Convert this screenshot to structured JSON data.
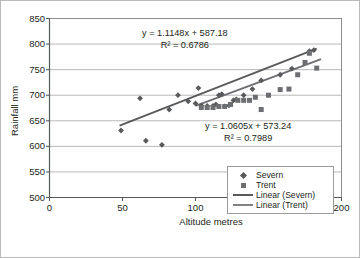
{
  "chart_data": {
    "type": "scatter",
    "title": "",
    "xlabel": "Altitude metres",
    "ylabel": "Rainfall mm",
    "xlim": [
      0,
      200
    ],
    "ylim": [
      500,
      850
    ],
    "xticks": [
      0,
      50,
      100,
      150,
      200
    ],
    "yticks": [
      500,
      550,
      600,
      650,
      700,
      750,
      800,
      850
    ],
    "grid": "horizontal",
    "legend_position": "bottom-right",
    "legend_entries": [
      {
        "label": "Severn",
        "marker": "diamond",
        "color": "#58595b"
      },
      {
        "label": "Trent",
        "marker": "square",
        "color": "#6d6e71"
      },
      {
        "label": "Linear (Severn)",
        "marker": "line",
        "color": "#58595b"
      },
      {
        "label": "Linear (Trent)",
        "marker": "line",
        "color": "#808285"
      }
    ],
    "annotations": [
      {
        "name": "severn-trendline-equation",
        "line1": "y = 1.1148x + 587.18",
        "line2": "R² = 0.6786"
      },
      {
        "name": "trent-trendline-equation",
        "line1": "y = 1.0605x + 573.24",
        "line2": "R² = 0.7989"
      }
    ],
    "series": [
      {
        "name": "Severn",
        "marker": "diamond",
        "color": "#58595b",
        "points": [
          [
            49,
            631
          ],
          [
            62,
            694
          ],
          [
            66,
            611
          ],
          [
            77,
            603
          ],
          [
            82,
            672
          ],
          [
            88,
            700
          ],
          [
            95,
            688
          ],
          [
            100,
            684
          ],
          [
            102,
            714
          ],
          [
            104,
            680
          ],
          [
            108,
            679
          ],
          [
            112,
            679
          ],
          [
            114,
            682
          ],
          [
            116,
            700
          ],
          [
            118,
            702
          ],
          [
            120,
            678
          ],
          [
            123,
            680
          ],
          [
            126,
            690
          ],
          [
            128,
            692
          ],
          [
            133,
            700
          ],
          [
            139,
            712
          ],
          [
            145,
            729
          ],
          [
            158,
            740
          ],
          [
            166,
            752
          ],
          [
            178,
            786
          ],
          [
            181,
            788
          ]
        ],
        "trendline": {
          "slope": 1.1148,
          "intercept": 587.18,
          "r2": 0.6786,
          "x_start": 48,
          "x_end": 183
        }
      },
      {
        "name": "Trent",
        "marker": "square",
        "color": "#6d6e71",
        "points": [
          [
            104,
            676
          ],
          [
            108,
            676
          ],
          [
            112,
            676
          ],
          [
            116,
            678
          ],
          [
            120,
            678
          ],
          [
            124,
            682
          ],
          [
            129,
            690
          ],
          [
            133,
            690
          ],
          [
            137,
            690
          ],
          [
            141,
            696
          ],
          [
            145,
            672
          ],
          [
            150,
            700
          ],
          [
            158,
            711
          ],
          [
            164,
            712
          ],
          [
            170,
            740
          ],
          [
            175,
            764
          ],
          [
            178,
            782
          ],
          [
            183,
            753
          ]
        ],
        "trendline": {
          "slope": 1.0605,
          "intercept": 573.24,
          "r2": 0.7989,
          "x_start": 100,
          "x_end": 186
        }
      }
    ]
  },
  "axes": {
    "ytick_labels": [
      "850",
      "800",
      "750",
      "700",
      "650",
      "600",
      "550",
      "500"
    ],
    "xtick_labels": [
      "0",
      "50",
      "100",
      "150",
      "200"
    ],
    "ylabel": "Rainfall mm",
    "xlabel": "Altitude metres"
  },
  "equations": {
    "severn_line1": "y = 1.1148x + 587.18",
    "severn_line2": "R² = 0.6786",
    "trent_line1": "y = 1.0605x + 573.24",
    "trent_line2": "R² = 0.7989"
  },
  "legend": {
    "severn": "Severn",
    "trent": "Trent",
    "linear_severn": "Linear (Severn)",
    "linear_trent": "Linear (Trent)"
  }
}
